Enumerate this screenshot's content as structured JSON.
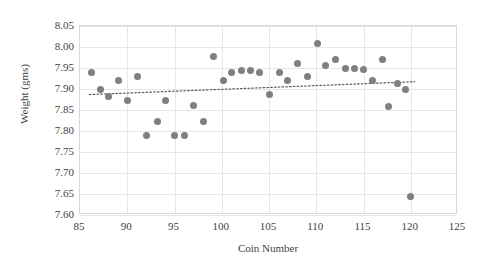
{
  "chart_data": {
    "type": "scatter",
    "title": "",
    "xlabel": "Coin Number",
    "ylabel": "Weight (gms)",
    "xlim": [
      85,
      125
    ],
    "ylim": [
      7.6,
      8.05
    ],
    "xticks": [
      85,
      90,
      95,
      100,
      105,
      110,
      115,
      120,
      125
    ],
    "ytick_labels": [
      "8.05",
      "8.00",
      "7.95",
      "7.90",
      "7.85",
      "7.80",
      "7.75",
      "7.70",
      "7.65",
      "7.60"
    ],
    "yticks": [
      8.05,
      8.0,
      7.95,
      7.9,
      7.85,
      7.8,
      7.75,
      7.7,
      7.65,
      7.6
    ],
    "grid": true,
    "legend": false,
    "marker_color": "#7f7f7f",
    "trendline": {
      "style": "dotted",
      "color": "#595959",
      "x_start": 86.0,
      "y_start": 7.885,
      "x_end": 120.6,
      "y_end": 7.916
    },
    "points": [
      {
        "x": 86.2,
        "y": 7.94
      },
      {
        "x": 87.2,
        "y": 7.9
      },
      {
        "x": 88.0,
        "y": 7.882
      },
      {
        "x": 89.1,
        "y": 7.92
      },
      {
        "x": 90.0,
        "y": 7.872
      },
      {
        "x": 91.1,
        "y": 7.93
      },
      {
        "x": 92.0,
        "y": 7.79
      },
      {
        "x": 93.2,
        "y": 7.822
      },
      {
        "x": 94.1,
        "y": 7.872
      },
      {
        "x": 95.0,
        "y": 7.79
      },
      {
        "x": 96.1,
        "y": 7.79
      },
      {
        "x": 97.0,
        "y": 7.86
      },
      {
        "x": 98.1,
        "y": 7.822
      },
      {
        "x": 99.1,
        "y": 7.978
      },
      {
        "x": 100.2,
        "y": 7.92
      },
      {
        "x": 101.0,
        "y": 7.94
      },
      {
        "x": 102.1,
        "y": 7.943
      },
      {
        "x": 103.0,
        "y": 7.943
      },
      {
        "x": 104.0,
        "y": 7.94
      },
      {
        "x": 105.1,
        "y": 7.888
      },
      {
        "x": 106.1,
        "y": 7.94
      },
      {
        "x": 107.0,
        "y": 7.92
      },
      {
        "x": 108.0,
        "y": 7.96
      },
      {
        "x": 109.1,
        "y": 7.93
      },
      {
        "x": 110.1,
        "y": 8.008
      },
      {
        "x": 111.0,
        "y": 7.955
      },
      {
        "x": 112.0,
        "y": 7.97
      },
      {
        "x": 113.1,
        "y": 7.95
      },
      {
        "x": 114.1,
        "y": 7.948
      },
      {
        "x": 115.0,
        "y": 7.946
      },
      {
        "x": 116.0,
        "y": 7.92
      },
      {
        "x": 117.0,
        "y": 7.97
      },
      {
        "x": 117.6,
        "y": 7.858
      },
      {
        "x": 118.6,
        "y": 7.912
      },
      {
        "x": 119.4,
        "y": 7.9
      },
      {
        "x": 120.0,
        "y": 7.645
      }
    ]
  }
}
